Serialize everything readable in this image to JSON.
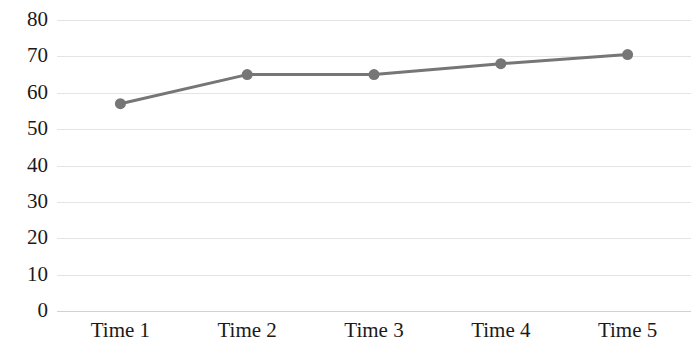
{
  "chart_data": {
    "type": "line",
    "title": "",
    "subtitle": "",
    "xlabel": "",
    "ylabel": "",
    "categories": [
      "Time 1",
      "Time 2",
      "Time 3",
      "Time 4",
      "Time 5"
    ],
    "series": [
      {
        "name": "Series 1",
        "values": [
          57,
          65,
          65,
          68,
          70.5
        ],
        "color": "#767676",
        "marker": "circle",
        "marker_color": "#767676",
        "line_width": 3
      }
    ],
    "ylim": [
      0,
      80
    ],
    "y_ticks": [
      0,
      10,
      20,
      30,
      40,
      50,
      60,
      70,
      80
    ],
    "y_tick_labels": [
      "0",
      "10",
      "20",
      "30",
      "40",
      "50",
      "60",
      "70",
      "80"
    ],
    "grid": true,
    "grid_color": "#e4e4e4",
    "axis_color": "#d2d2d2",
    "legend": false,
    "legend_position": "none",
    "background_color": "#ffffff",
    "text_color": "#1a1a1a"
  }
}
